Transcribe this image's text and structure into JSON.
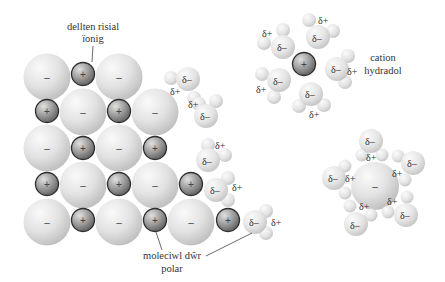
{
  "labels": {
    "ionic_crystal_line1": "dellten risial",
    "ionic_crystal_line2": "ïonig",
    "hydrated_cation_line1": "cation",
    "hydrated_cation_line2": "hydradol",
    "polar_water_line1": "moleciwl dŵr",
    "polar_water_line2": "polar"
  },
  "symbols": {
    "anion": "–",
    "cation": "+",
    "delta_plus": "δ+",
    "delta_minus": "δ–"
  },
  "colors": {
    "anion_light": "#f4f4f4",
    "anion_dark": "#bdbdbd",
    "cation_light": "#d9d9d9",
    "cation_dark": "#6e6e6e",
    "cation_border": "#2e2e2e",
    "water_light": "#f6f6f6",
    "water_dark": "#c6c6c6",
    "leader_line": "#444444"
  },
  "crystal": {
    "anions": [
      {
        "x": 47,
        "y": 77
      },
      {
        "x": 119,
        "y": 77
      },
      {
        "x": 83,
        "y": 112
      },
      {
        "x": 155,
        "y": 112
      },
      {
        "x": 47,
        "y": 148
      },
      {
        "x": 119,
        "y": 148
      },
      {
        "x": 83,
        "y": 185
      },
      {
        "x": 155,
        "y": 185
      },
      {
        "x": 47,
        "y": 222
      },
      {
        "x": 119,
        "y": 222
      },
      {
        "x": 191,
        "y": 222
      }
    ],
    "cations": [
      {
        "x": 83,
        "y": 74
      },
      {
        "x": 47,
        "y": 111
      },
      {
        "x": 119,
        "y": 111
      },
      {
        "x": 83,
        "y": 148
      },
      {
        "x": 155,
        "y": 148
      },
      {
        "x": 47,
        "y": 184
      },
      {
        "x": 119,
        "y": 184
      },
      {
        "x": 191,
        "y": 184
      },
      {
        "x": 83,
        "y": 220
      },
      {
        "x": 155,
        "y": 220
      },
      {
        "x": 228,
        "y": 220
      }
    ]
  },
  "hydrated_cation": {
    "center": {
      "x": 304,
      "y": 64
    }
  },
  "hydrated_anion": {
    "center": {
      "x": 375,
      "y": 186
    }
  }
}
